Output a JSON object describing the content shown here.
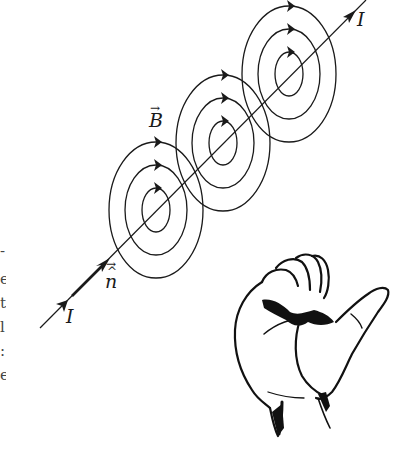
{
  "figure": {
    "labels": {
      "current_top": "I",
      "current_bottom": "I",
      "field": "B",
      "normal": "n",
      "vector_arrow": "→",
      "hat": "^"
    },
    "wire": {
      "x1": 40,
      "y1": 328,
      "x2": 366,
      "y2": 0
    },
    "ring_groups": [
      {
        "cx": 156,
        "cy": 210
      },
      {
        "cx": 223,
        "cy": 143
      },
      {
        "cx": 289,
        "cy": 74
      }
    ],
    "ring_radii": [
      {
        "rx": 47,
        "ry": 68
      },
      {
        "rx": 31,
        "ry": 45
      },
      {
        "rx": 14,
        "ry": 22
      }
    ],
    "colors": {
      "ink": "#1a1a1a",
      "background": "#ffffff"
    },
    "left_edge_fragments": [
      "-",
      "e",
      "t",
      "l",
      ":",
      "e"
    ]
  }
}
